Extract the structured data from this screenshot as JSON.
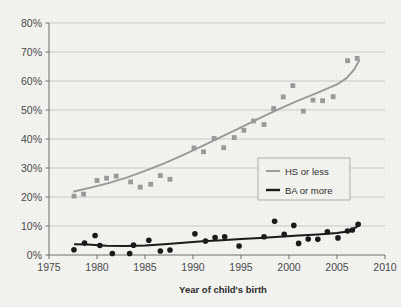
{
  "chart_data": {
    "type": "scatter",
    "title": "",
    "xlabel": "Year of child's birth",
    "ylabel": "",
    "xlim": [
      1975,
      2010
    ],
    "ylim": [
      0,
      0.8
    ],
    "xticks": [
      1975,
      1980,
      1985,
      1990,
      1995,
      2000,
      2005,
      2010
    ],
    "xtick_labels": [
      "1975",
      "1980",
      "1985",
      "1990",
      "1995",
      "2000",
      "2005",
      "2010"
    ],
    "yticks": [
      0,
      10,
      20,
      30,
      40,
      50,
      60,
      70,
      80
    ],
    "ytick_labels": [
      "0%",
      "10%",
      "20%",
      "30%",
      "40%",
      "50%",
      "60%",
      "70%",
      "80%"
    ],
    "grid": "horizontal",
    "legend_position": "center-right",
    "series": [
      {
        "name": "HS or less",
        "color": "#9a9a9a",
        "marker": "square",
        "points": [
          {
            "x": 1977.6,
            "y": 20.3
          },
          {
            "x": 1978.6,
            "y": 21.0
          },
          {
            "x": 1980.0,
            "y": 25.7
          },
          {
            "x": 1981.0,
            "y": 26.5
          },
          {
            "x": 1982.0,
            "y": 27.2
          },
          {
            "x": 1983.5,
            "y": 25.2
          },
          {
            "x": 1984.5,
            "y": 23.4
          },
          {
            "x": 1985.6,
            "y": 24.4
          },
          {
            "x": 1986.6,
            "y": 27.4
          },
          {
            "x": 1987.6,
            "y": 26.1
          },
          {
            "x": 1990.1,
            "y": 36.9
          },
          {
            "x": 1991.1,
            "y": 35.6
          },
          {
            "x": 1992.2,
            "y": 40.2
          },
          {
            "x": 1993.2,
            "y": 37.0
          },
          {
            "x": 1994.3,
            "y": 40.5
          },
          {
            "x": 1995.3,
            "y": 43.0
          },
          {
            "x": 1996.3,
            "y": 46.2
          },
          {
            "x": 1997.4,
            "y": 45.0
          },
          {
            "x": 1998.4,
            "y": 50.5
          },
          {
            "x": 1999.4,
            "y": 54.5
          },
          {
            "x": 2000.4,
            "y": 58.4
          },
          {
            "x": 2001.5,
            "y": 49.6
          },
          {
            "x": 2002.5,
            "y": 53.4
          },
          {
            "x": 2003.5,
            "y": 53.2
          },
          {
            "x": 2004.6,
            "y": 54.6
          },
          {
            "x": 2006.1,
            "y": 67.0
          },
          {
            "x": 2007.1,
            "y": 67.8
          }
        ],
        "trend": [
          {
            "x": 1977.6,
            "y": 21.9
          },
          {
            "x": 1979.0,
            "y": 23.0
          },
          {
            "x": 1981.0,
            "y": 24.6
          },
          {
            "x": 1983.0,
            "y": 26.6
          },
          {
            "x": 1985.0,
            "y": 29.0
          },
          {
            "x": 1987.0,
            "y": 31.6
          },
          {
            "x": 1989.0,
            "y": 34.5
          },
          {
            "x": 1991.0,
            "y": 37.6
          },
          {
            "x": 1993.0,
            "y": 40.8
          },
          {
            "x": 1995.0,
            "y": 44.0
          },
          {
            "x": 1997.0,
            "y": 47.3
          },
          {
            "x": 1999.0,
            "y": 50.4
          },
          {
            "x": 2001.0,
            "y": 53.3
          },
          {
            "x": 2003.0,
            "y": 56.0
          },
          {
            "x": 2005.0,
            "y": 58.8
          },
          {
            "x": 2006.0,
            "y": 61.0
          },
          {
            "x": 2006.8,
            "y": 64.0
          },
          {
            "x": 2007.3,
            "y": 67.0
          }
        ]
      },
      {
        "name": "BA or more",
        "color": "#1a1a1a",
        "marker": "circle",
        "points": [
          {
            "x": 1977.6,
            "y": 1.8
          },
          {
            "x": 1978.7,
            "y": 4.1
          },
          {
            "x": 1979.8,
            "y": 6.7
          },
          {
            "x": 1980.3,
            "y": 3.3
          },
          {
            "x": 1981.6,
            "y": 0.5
          },
          {
            "x": 1983.4,
            "y": 0.5
          },
          {
            "x": 1983.8,
            "y": 3.4
          },
          {
            "x": 1985.4,
            "y": 5.1
          },
          {
            "x": 1986.6,
            "y": 1.4
          },
          {
            "x": 1987.6,
            "y": 1.7
          },
          {
            "x": 1990.2,
            "y": 7.3
          },
          {
            "x": 1991.3,
            "y": 4.8
          },
          {
            "x": 1992.3,
            "y": 6.0
          },
          {
            "x": 1993.3,
            "y": 6.3
          },
          {
            "x": 1994.8,
            "y": 3.1
          },
          {
            "x": 1997.4,
            "y": 6.3
          },
          {
            "x": 1998.5,
            "y": 11.6
          },
          {
            "x": 1999.5,
            "y": 7.1
          },
          {
            "x": 2000.5,
            "y": 10.2
          },
          {
            "x": 2001.0,
            "y": 4.0
          },
          {
            "x": 2002.0,
            "y": 5.5
          },
          {
            "x": 2003.0,
            "y": 5.4
          },
          {
            "x": 2004.0,
            "y": 8.0
          },
          {
            "x": 2005.1,
            "y": 5.9
          },
          {
            "x": 2006.1,
            "y": 8.3
          },
          {
            "x": 2006.6,
            "y": 8.6
          },
          {
            "x": 2007.2,
            "y": 10.6
          }
        ],
        "trend": [
          {
            "x": 1977.7,
            "y": 3.7
          },
          {
            "x": 1979.0,
            "y": 3.6
          },
          {
            "x": 1981.0,
            "y": 3.2
          },
          {
            "x": 1983.0,
            "y": 3.1
          },
          {
            "x": 1985.0,
            "y": 3.3
          },
          {
            "x": 1987.0,
            "y": 3.7
          },
          {
            "x": 1989.0,
            "y": 4.2
          },
          {
            "x": 1991.0,
            "y": 4.7
          },
          {
            "x": 1993.0,
            "y": 5.1
          },
          {
            "x": 1995.0,
            "y": 5.5
          },
          {
            "x": 1997.0,
            "y": 5.9
          },
          {
            "x": 1999.0,
            "y": 6.3
          },
          {
            "x": 2001.0,
            "y": 6.7
          },
          {
            "x": 2003.0,
            "y": 7.1
          },
          {
            "x": 2005.0,
            "y": 7.6
          },
          {
            "x": 2006.3,
            "y": 8.2
          },
          {
            "x": 2007.0,
            "y": 9.6
          },
          {
            "x": 2007.4,
            "y": 10.6
          }
        ]
      }
    ]
  },
  "legend": {
    "items": [
      {
        "label": "HS or less",
        "color": "#9a9a9a"
      },
      {
        "label": "BA or more",
        "color": "#1a1a1a"
      }
    ]
  },
  "colors": {
    "background": "#f3f3f0",
    "grid": "#b9b9b9",
    "axis": "#6e6e6e",
    "text": "#444444",
    "series_gray": "#9a9a9a",
    "series_black": "#1a1a1a"
  }
}
